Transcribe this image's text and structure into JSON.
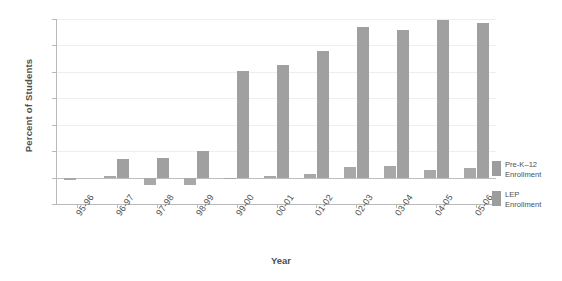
{
  "chart_data": {
    "type": "bar",
    "title": "",
    "xlabel": "Year",
    "ylabel": "Percent of Students",
    "categories": [
      "95-96",
      "96-97",
      "97-98",
      "98-99",
      "99-00",
      "00-01",
      "01-02",
      "02-03",
      "03-04",
      "04-05",
      "05-06"
    ],
    "series": [
      {
        "name": "Pre-K-12 Enrollment",
        "values": [
          -1,
          0.5,
          -3,
          -3,
          -0.5,
          0.5,
          1.5,
          4,
          4.5,
          3,
          3.5
        ]
      },
      {
        "name": "LEP Enrollment",
        "values": [
          0,
          7,
          7.5,
          10,
          40.5,
          42.5,
          48,
          57,
          56,
          59.5,
          58.5
        ]
      }
    ],
    "ylim": [
      -10,
      60
    ],
    "yticks": [
      -10,
      0,
      10,
      20,
      30,
      40,
      50,
      60
    ],
    "ytick_labels": [
      "-10",
      "0",
      "10",
      "20",
      "30",
      "40",
      "50",
      "60"
    ],
    "grid": true,
    "legend_position": "right",
    "bar_color": "#9d9d9d"
  },
  "legend": {
    "entries": [
      {
        "line1": "Pre-K–12",
        "line2": "Enrollment"
      },
      {
        "line1": "LEP",
        "line2": "Enrollment"
      }
    ]
  }
}
